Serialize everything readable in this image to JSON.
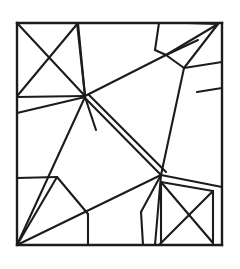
{
  "figure": {
    "kind": "line-drawing",
    "canvas": {
      "width": 240,
      "height": 269
    },
    "background_color": "#ffffff",
    "ink_color": "#1c1c1c",
    "stroke_width": 2.1,
    "border_stroke_width": 2.4,
    "bounds": {
      "left": 17,
      "top": 23,
      "right": 222,
      "bottom": 245
    },
    "vertices": {
      "corner_tl": [
        17,
        23
      ],
      "corner_tr": [
        222,
        23
      ],
      "corner_br": [
        222,
        245
      ],
      "corner_bl": [
        17,
        245
      ],
      "hub_upper": [
        85,
        96
      ],
      "hub_lower": [
        161,
        175
      ],
      "tl_box_br": [
        85,
        96
      ],
      "tl_box_top_right": [
        78,
        23
      ]
    },
    "segments": [
      {
        "name": "border-top",
        "x1": 17,
        "y1": 23,
        "x2": 222,
        "y2": 23
      },
      {
        "name": "border-right",
        "x1": 222,
        "y1": 23,
        "x2": 222,
        "y2": 245
      },
      {
        "name": "border-bottom",
        "x1": 222,
        "y1": 245,
        "x2": 17,
        "y2": 245
      },
      {
        "name": "border-left",
        "x1": 17,
        "y1": 245,
        "x2": 17,
        "y2": 23
      },
      {
        "name": "tl-box-bottom",
        "x1": 17,
        "y1": 97,
        "x2": 85,
        "y2": 96
      },
      {
        "name": "tl-box-right",
        "x1": 78,
        "y1": 23,
        "x2": 85,
        "y2": 96
      },
      {
        "name": "tl-box-diag-down",
        "x1": 17,
        "y1": 23,
        "x2": 85,
        "y2": 96
      },
      {
        "name": "tl-box-diag-up",
        "x1": 78,
        "y1": 23,
        "x2": 18,
        "y2": 95
      },
      {
        "name": "left-slant-to-hub",
        "x1": 17,
        "y1": 113,
        "x2": 85,
        "y2": 97
      },
      {
        "name": "hub-to-top-edge",
        "x1": 85,
        "y1": 96,
        "x2": 77,
        "y2": 23
      },
      {
        "name": "hub-long-diagonal-ne",
        "x1": 85,
        "y1": 96,
        "x2": 166,
        "y2": 55
      },
      {
        "name": "ne-diag-to-corner",
        "x1": 166,
        "y1": 55,
        "x2": 198,
        "y2": 40
      },
      {
        "name": "top-spur-a",
        "x1": 159,
        "y1": 23,
        "x2": 155,
        "y2": 50
      },
      {
        "name": "top-spur-b",
        "x1": 155,
        "y1": 50,
        "x2": 166,
        "y2": 55
      },
      {
        "name": "corner-tr-ray-1",
        "x1": 218,
        "y1": 24,
        "x2": 166,
        "y2": 55
      },
      {
        "name": "corner-tr-ray-2",
        "x1": 218,
        "y1": 24,
        "x2": 184,
        "y2": 68
      },
      {
        "name": "corner-tr-ray-3",
        "x1": 218,
        "y1": 24,
        "x2": 188,
        "y2": 23
      },
      {
        "name": "tr-branch-down",
        "x1": 184,
        "y1": 68,
        "x2": 166,
        "y2": 55
      },
      {
        "name": "tr-branch-right",
        "x1": 184,
        "y1": 68,
        "x2": 222,
        "y2": 62
      },
      {
        "name": "tr-branch-to-hub-lower",
        "x1": 184,
        "y1": 68,
        "x2": 161,
        "y2": 175
      },
      {
        "name": "right-cell-divider",
        "x1": 197,
        "y1": 92,
        "x2": 222,
        "y2": 88
      },
      {
        "name": "center-double-line-a",
        "x1": 85,
        "y1": 98,
        "x2": 161,
        "y2": 175
      },
      {
        "name": "center-double-line-b",
        "x1": 89,
        "y1": 95,
        "x2": 166,
        "y2": 172
      },
      {
        "name": "hub-upper-spur-down",
        "x1": 85,
        "y1": 97,
        "x2": 96,
        "y2": 130
      },
      {
        "name": "hub-upper-to-left-low",
        "x1": 85,
        "y1": 97,
        "x2": 17,
        "y2": 245
      },
      {
        "name": "left-mid-horizontal",
        "x1": 17,
        "y1": 178,
        "x2": 57,
        "y2": 177
      },
      {
        "name": "bl-ray-1",
        "x1": 17,
        "y1": 245,
        "x2": 57,
        "y2": 177
      },
      {
        "name": "bl-ray-2",
        "x1": 17,
        "y1": 245,
        "x2": 161,
        "y2": 175
      },
      {
        "name": "bl-cell-right",
        "x1": 57,
        "y1": 177,
        "x2": 88,
        "y2": 214
      },
      {
        "name": "bl-cell-vertical",
        "x1": 88,
        "y1": 214,
        "x2": 88,
        "y2": 245
      },
      {
        "name": "hub-lower-to-bottom",
        "x1": 161,
        "y1": 175,
        "x2": 155,
        "y2": 245
      },
      {
        "name": "hub-lower-spur-short",
        "x1": 161,
        "y1": 175,
        "x2": 141,
        "y2": 212
      },
      {
        "name": "bottom-short-slant",
        "x1": 141,
        "y1": 212,
        "x2": 143,
        "y2": 245
      },
      {
        "name": "hub-lower-to-right",
        "x1": 161,
        "y1": 175,
        "x2": 222,
        "y2": 187
      },
      {
        "name": "br-box-top",
        "x1": 161,
        "y1": 182,
        "x2": 213,
        "y2": 191
      },
      {
        "name": "br-box-left",
        "x1": 161,
        "y1": 182,
        "x2": 161,
        "y2": 245
      },
      {
        "name": "br-box-diag-down",
        "x1": 161,
        "y1": 182,
        "x2": 213,
        "y2": 243
      },
      {
        "name": "br-box-diag-up",
        "x1": 213,
        "y1": 191,
        "x2": 160,
        "y2": 244
      },
      {
        "name": "br-box-right",
        "x1": 213,
        "y1": 191,
        "x2": 213,
        "y2": 243
      }
    ]
  }
}
